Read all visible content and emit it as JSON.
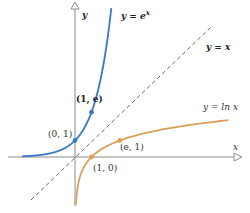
{
  "chart_data": {
    "type": "line",
    "title": "",
    "xlabel": "x",
    "ylabel": "y",
    "grid": false,
    "series": [
      {
        "name": "y = e^x",
        "label": "y = eˣ",
        "color": "#3a78c2",
        "style": "solid",
        "x_range": [
          -3.2,
          2.2
        ]
      },
      {
        "name": "y = x",
        "label": "y = x",
        "color": "#555555",
        "style": "dashed",
        "x_range": [
          -2.7,
          8.2
        ]
      },
      {
        "name": "y = ln x",
        "label": "y = ln x",
        "color": "#d9a05a",
        "style": "solid",
        "x_range": [
          0.055,
          9.3
        ]
      }
    ],
    "points": [
      {
        "label": "(0, 1)",
        "x": 0,
        "y": 1,
        "series": "y = e^x"
      },
      {
        "label": "(1, e)",
        "x": 1,
        "y": 2.718,
        "series": "y = e^x"
      },
      {
        "label": "(1, 0)",
        "x": 1,
        "y": 0,
        "series": "y = ln x"
      },
      {
        "label": "(e, 1)",
        "x": 2.718,
        "y": 1,
        "series": "y = ln x"
      }
    ],
    "axes": {
      "x_label": "x",
      "y_label": "y"
    }
  },
  "labels": {
    "y_axis": "y",
    "x_axis": "x",
    "exp": "y = e",
    "exp_sup": "x",
    "identity": "y = x",
    "ln": "y = ln x",
    "p01": "(0, 1)",
    "p1e": "(1, e)",
    "p10": "(1, 0)",
    "pe1": "(e, 1)"
  },
  "colors": {
    "exp": "#3a78c2",
    "ln": "#d9a05a",
    "axis": "#777777",
    "identity": "#555555"
  }
}
